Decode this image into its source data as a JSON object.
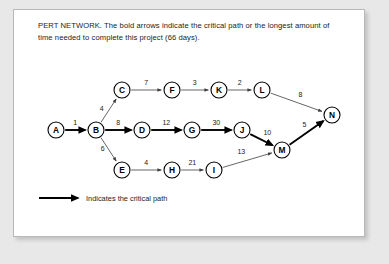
{
  "caption": "PERT NETWORK. The bold arrows indicate the critical path or the longest amount of time needed to complete this project (66 days).",
  "legend": {
    "text": "Indicates the critical path"
  },
  "colors": {
    "page_background": "#e8e8e8",
    "card_background": "#ffffff",
    "card_border": "#b8b8b8",
    "ink": "#1b1b1b",
    "edge_normal": "#4a4a4a",
    "edge_critical": "#000000"
  },
  "chart_data": {
    "type": "diagram",
    "title": "PERT NETWORK",
    "total_duration_days": 66,
    "critical_path": [
      "A",
      "B",
      "D",
      "G",
      "J",
      "M",
      "N"
    ],
    "nodes": [
      {
        "id": "A",
        "label": "A",
        "x": 42,
        "y": 120
      },
      {
        "id": "B",
        "label": "B",
        "x": 82,
        "y": 120
      },
      {
        "id": "C",
        "label": "C",
        "x": 108,
        "y": 80
      },
      {
        "id": "D",
        "label": "D",
        "x": 128,
        "y": 120
      },
      {
        "id": "E",
        "label": "E",
        "x": 108,
        "y": 160
      },
      {
        "id": "F",
        "label": "F",
        "x": 158,
        "y": 80
      },
      {
        "id": "G",
        "label": "G",
        "x": 178,
        "y": 120
      },
      {
        "id": "H",
        "label": "H",
        "x": 158,
        "y": 160
      },
      {
        "id": "I",
        "label": "I",
        "x": 200,
        "y": 160
      },
      {
        "id": "J",
        "label": "J",
        "x": 228,
        "y": 120
      },
      {
        "id": "K",
        "label": "K",
        "x": 205,
        "y": 80
      },
      {
        "id": "L",
        "label": "L",
        "x": 248,
        "y": 80
      },
      {
        "id": "M",
        "label": "M",
        "x": 268,
        "y": 140
      },
      {
        "id": "N",
        "label": "N",
        "x": 318,
        "y": 105
      }
    ],
    "edges": [
      {
        "from": "A",
        "to": "B",
        "weight": 1,
        "critical": true,
        "label_dx": 0,
        "label_dy": -5
      },
      {
        "from": "B",
        "to": "C",
        "weight": 4,
        "critical": false,
        "label_dx": -7,
        "label_dy": 0
      },
      {
        "from": "B",
        "to": "D",
        "weight": 8,
        "critical": true,
        "label_dx": 0,
        "label_dy": -5
      },
      {
        "from": "B",
        "to": "E",
        "weight": 6,
        "critical": false,
        "label_dx": -6,
        "label_dy": 2
      },
      {
        "from": "C",
        "to": "F",
        "weight": 7,
        "critical": false,
        "label_dx": 0,
        "label_dy": -5
      },
      {
        "from": "D",
        "to": "G",
        "weight": 12,
        "critical": true,
        "label_dx": 0,
        "label_dy": -5
      },
      {
        "from": "E",
        "to": "H",
        "weight": 4,
        "critical": false,
        "label_dx": 0,
        "label_dy": -5
      },
      {
        "from": "F",
        "to": "K",
        "weight": 3,
        "critical": false,
        "label_dx": 0,
        "label_dy": -5
      },
      {
        "from": "G",
        "to": "J",
        "weight": 30,
        "critical": true,
        "label_dx": 0,
        "label_dy": -5
      },
      {
        "from": "H",
        "to": "I",
        "weight": 21,
        "critical": false,
        "label_dx": 0,
        "label_dy": -5
      },
      {
        "from": "I",
        "to": "M",
        "weight": 13,
        "critical": false,
        "label_dx": -6,
        "label_dy": -6
      },
      {
        "from": "J",
        "to": "M",
        "weight": 10,
        "critical": true,
        "label_dx": 6,
        "label_dy": -5
      },
      {
        "from": "K",
        "to": "L",
        "weight": 2,
        "critical": false,
        "label_dx": 0,
        "label_dy": -5
      },
      {
        "from": "L",
        "to": "N",
        "weight": 8,
        "critical": false,
        "label_dx": 4,
        "label_dy": -5
      },
      {
        "from": "M",
        "to": "N",
        "weight": 5,
        "critical": true,
        "label_dx": -2,
        "label_dy": -6
      }
    ]
  }
}
